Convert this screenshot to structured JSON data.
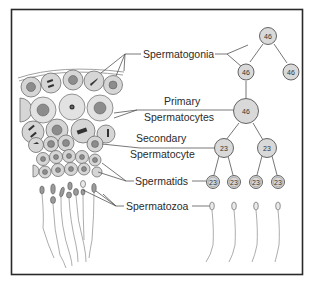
{
  "figure": {
    "labels": {
      "spermatogonia": "Spermatogonia",
      "primary_line1": "Primary",
      "primary_line2": "Spermatocytes",
      "secondary_line1": "Secondary",
      "secondary_line2": "Spermatocyte",
      "spermatids": "Spermatids",
      "spermatozoa": "Spermatozoa"
    },
    "chromosome_counts": {
      "spermatogonia_top": "46",
      "spermatogonia_left": "46",
      "spermatogonia_right": "46",
      "primary": "46",
      "secondary_left": "23",
      "secondary_right": "23",
      "spermatid_1": "23",
      "spermatid_2": "23",
      "spermatid_3": "23",
      "spermatid_4": "23"
    },
    "colors": {
      "frame": "#2a2a2a",
      "cell_fill": "#d9d9d9",
      "text": "#2b2b2b"
    }
  }
}
